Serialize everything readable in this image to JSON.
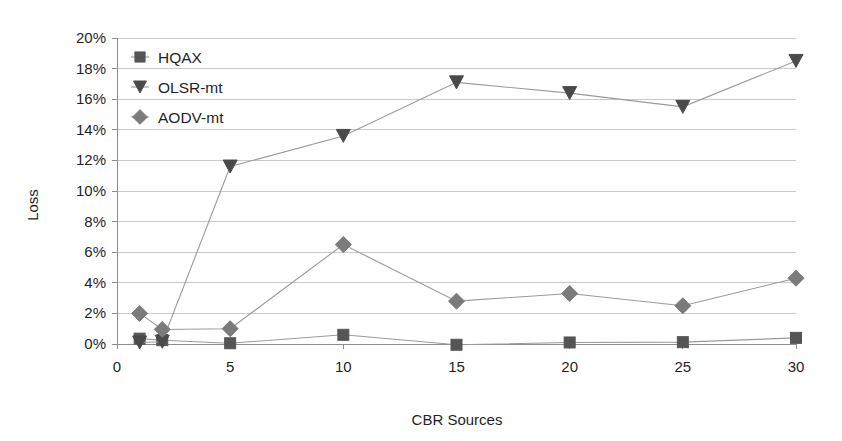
{
  "chart_data": {
    "type": "line",
    "title": "",
    "subtitle": "",
    "xlabel": "CBR Sources",
    "ylabel": "Loss",
    "x": [
      1,
      2,
      5,
      10,
      15,
      20,
      25,
      30
    ],
    "xlim": [
      0,
      30
    ],
    "ylim": [
      0,
      20
    ],
    "xticks": [
      "0",
      "5",
      "10",
      "15",
      "20",
      "25",
      "30"
    ],
    "xtick_values": [
      0,
      5,
      10,
      15,
      20,
      25,
      30
    ],
    "yticks": [
      "0%",
      "2%",
      "4%",
      "6%",
      "8%",
      "10%",
      "12%",
      "14%",
      "16%",
      "18%",
      "20%"
    ],
    "ytick_values": [
      0,
      2,
      4,
      6,
      8,
      10,
      12,
      14,
      16,
      18,
      20
    ],
    "grid": true,
    "grid_axis": "y",
    "legend_position": "top-left",
    "y_unit": "%",
    "series": [
      {
        "name": "HQAX",
        "marker": "square",
        "color": "#555555",
        "line_color": "#9a9a9a",
        "values": [
          0.35,
          0.25,
          0.05,
          0.6,
          -0.05,
          0.1,
          0.12,
          0.4
        ]
      },
      {
        "name": "OLSR-mt",
        "marker": "triangle-down",
        "color": "#4a4a4a",
        "line_color": "#9a9a9a",
        "values": [
          0.1,
          0.15,
          11.6,
          13.6,
          17.1,
          16.4,
          15.5,
          18.5
        ]
      },
      {
        "name": "AODV-mt",
        "marker": "diamond",
        "color": "#7b7b7b",
        "line_color": "#9a9a9a",
        "values": [
          2.0,
          0.95,
          1.0,
          6.5,
          2.8,
          3.3,
          2.5,
          4.3
        ]
      }
    ]
  },
  "legend": {
    "items": [
      {
        "label": "HQAX",
        "marker": "square"
      },
      {
        "label": "OLSR-mt",
        "marker": "triangle-down"
      },
      {
        "label": "AODV-mt",
        "marker": "diamond"
      }
    ]
  },
  "axes": {
    "x_title": "CBR Sources",
    "y_title": "Loss"
  }
}
